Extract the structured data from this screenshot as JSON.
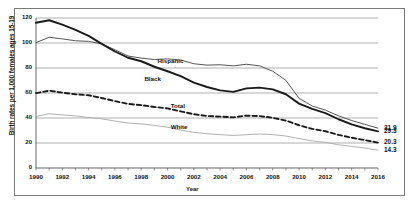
{
  "chart_data": {
    "type": "line",
    "title": "",
    "xlabel": "Year",
    "ylabel": "Birth rates per 1,000 females ages 15-19",
    "xlim": [
      1990,
      2016
    ],
    "ylim": [
      0,
      120
    ],
    "ytick_labels": [
      "0",
      "20",
      "40",
      "60",
      "80",
      "100",
      "120"
    ],
    "ytick_values": [
      0,
      20,
      40,
      60,
      80,
      100,
      120
    ],
    "xtick_labels": [
      "1990",
      "1992",
      "1994",
      "1996",
      "1998",
      "2000",
      "2002",
      "2004",
      "2006",
      "2008",
      "2010",
      "2012",
      "2014",
      "2016"
    ],
    "xtick_values": [
      1990,
      1992,
      1994,
      1996,
      1998,
      2000,
      2002,
      2004,
      2006,
      2008,
      2010,
      2012,
      2014,
      2016
    ],
    "grid": "horizontal",
    "legend_position": "inline-annotations",
    "x": [
      1990,
      1991,
      1992,
      1993,
      1994,
      1995,
      1996,
      1997,
      1998,
      1999,
      2000,
      2001,
      2002,
      2003,
      2004,
      2005,
      2006,
      2007,
      2008,
      2009,
      2010,
      2011,
      2012,
      2013,
      2014,
      2015,
      2016
    ],
    "series": [
      {
        "name": "Hispanic",
        "color": "#555555",
        "style": "solid-thin",
        "end_value": "31.9",
        "label_x": 2000,
        "label_y": 86,
        "values": [
          100.3,
          104.6,
          103.3,
          101.8,
          101.3,
          99.3,
          94.6,
          89.6,
          87.9,
          86.8,
          87.3,
          86.4,
          83.4,
          82.3,
          82.6,
          81.7,
          83.0,
          81.7,
          77.4,
          70.1,
          55.7,
          49.6,
          46.3,
          41.7,
          38.0,
          34.9,
          31.9
        ]
      },
      {
        "name": "Black",
        "color": "#1a1a1a",
        "style": "solid-thick",
        "end_value": "29.3",
        "label_x": 1999,
        "label_y": 71,
        "values": [
          116.2,
          118.2,
          114.7,
          110.5,
          105.7,
          99.3,
          93.2,
          88.2,
          85.4,
          81.0,
          77.4,
          73.5,
          68.3,
          64.8,
          62.1,
          60.9,
          63.7,
          64.3,
          62.9,
          59.0,
          51.5,
          47.3,
          43.9,
          39.0,
          34.9,
          31.8,
          29.3
        ]
      },
      {
        "name": "Total",
        "color": "#1a1a1a",
        "style": "dashed",
        "end_value": "20.3",
        "label_x": 2001,
        "label_y": 50,
        "values": [
          59.9,
          61.8,
          60.3,
          59.0,
          58.2,
          56.0,
          53.5,
          51.3,
          50.3,
          48.8,
          47.7,
          45.3,
          43.0,
          41.6,
          41.1,
          40.5,
          41.9,
          41.5,
          40.2,
          37.9,
          34.2,
          31.3,
          29.4,
          26.5,
          24.2,
          22.3,
          20.3
        ]
      },
      {
        "name": "White",
        "color": "#b0b0b0",
        "style": "solid-light",
        "end_value": "14.3",
        "label_x": 2001,
        "label_y": 33,
        "values": [
          41.2,
          43.4,
          42.5,
          41.7,
          40.4,
          39.3,
          37.6,
          36.0,
          35.3,
          34.1,
          32.6,
          30.3,
          28.5,
          27.4,
          26.7,
          26.0,
          26.7,
          27.2,
          26.7,
          25.6,
          23.5,
          21.7,
          20.5,
          18.6,
          17.3,
          16.0,
          14.3
        ]
      }
    ]
  }
}
